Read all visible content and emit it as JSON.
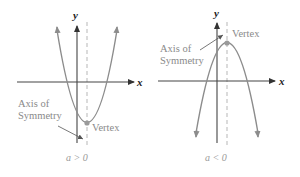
{
  "figure": {
    "panels": [
      {
        "id": "left",
        "condition": "a > 0",
        "x_axis_label": "x",
        "y_axis_label": "y",
        "annotations": {
          "axis_of_symmetry_line1": "Axis of",
          "axis_of_symmetry_line2": "Symmetry",
          "vertex": "Vertex"
        },
        "shape": "upward parabola"
      },
      {
        "id": "right",
        "condition": "a < 0",
        "x_axis_label": "x",
        "y_axis_label": "y",
        "annotations": {
          "axis_of_symmetry_line1": "Axis of",
          "axis_of_symmetry_line2": "Symmetry",
          "vertex": "Vertex"
        },
        "shape": "downward parabola"
      }
    ],
    "colors": {
      "curve": "#8c8c8c",
      "axis": "#333333",
      "dashed_axis": "#bdbdbd",
      "vertex_dot": "#999999",
      "label_text": "#8a8a8a"
    }
  }
}
